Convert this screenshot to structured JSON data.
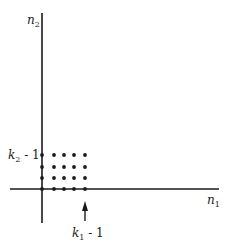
{
  "diagram": {
    "axes": {
      "x_label": "n",
      "x_label_sub": "1",
      "y_label": "n",
      "y_label_sub": "2"
    },
    "markers": {
      "y_marker": {
        "var": "k",
        "sub": "2",
        "suffix": " - 1"
      },
      "x_marker": {
        "var": "k",
        "sub": "1",
        "suffix": " - 1"
      }
    },
    "grid": {
      "columns": 5,
      "rows": 4,
      "description": "lattice points 0..k1-1 by 0..k2-1"
    },
    "colors": {
      "ink": "#1a1a1a",
      "background": "#ffffff"
    }
  }
}
